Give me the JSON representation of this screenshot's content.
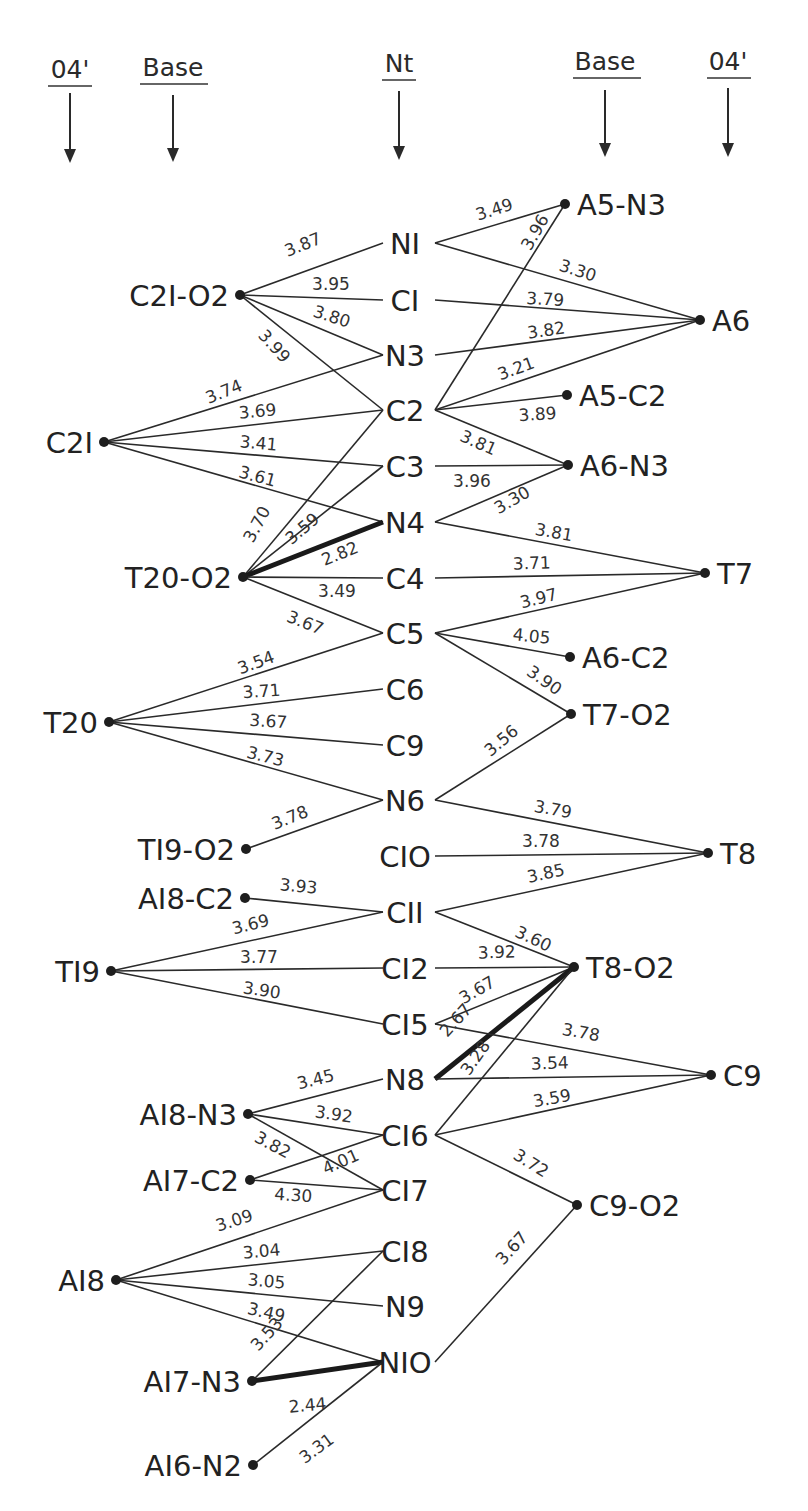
{
  "headers": [
    {
      "id": "o4-left",
      "label": "04'",
      "x": 70,
      "label_y": 78,
      "underline": [
        48,
        92,
        86
      ],
      "arrow": [
        93,
        163
      ]
    },
    {
      "id": "base-left",
      "label": "Base",
      "x": 173,
      "label_y": 76,
      "underline": [
        140,
        208,
        84
      ],
      "arrow": [
        95,
        162
      ]
    },
    {
      "id": "nt",
      "label": "Nt",
      "x": 399,
      "label_y": 72,
      "underline": [
        382,
        416,
        80
      ],
      "arrow": [
        91,
        160
      ]
    },
    {
      "id": "base-right",
      "label": "Base",
      "x": 605,
      "label_y": 70,
      "underline": [
        573,
        641,
        78
      ],
      "arrow": [
        90,
        157
      ]
    },
    {
      "id": "o4-right",
      "label": "04'",
      "x": 728,
      "label_y": 70,
      "underline": [
        707,
        751,
        78
      ],
      "arrow": [
        88,
        157
      ]
    }
  ],
  "nt_atoms": [
    {
      "id": "N1",
      "label": "NI",
      "x": 405,
      "y": 243
    },
    {
      "id": "C1",
      "label": "CI",
      "x": 405,
      "y": 300
    },
    {
      "id": "N3",
      "label": "N3",
      "x": 405,
      "y": 355
    },
    {
      "id": "C2",
      "label": "C2",
      "x": 405,
      "y": 410
    },
    {
      "id": "C3",
      "label": "C3",
      "x": 405,
      "y": 466
    },
    {
      "id": "N4",
      "label": "N4",
      "x": 405,
      "y": 522
    },
    {
      "id": "C4",
      "label": "C4",
      "x": 405,
      "y": 578
    },
    {
      "id": "C5",
      "label": "C5",
      "x": 405,
      "y": 633
    },
    {
      "id": "C6",
      "label": "C6",
      "x": 405,
      "y": 689
    },
    {
      "id": "C9n",
      "label": "C9",
      "x": 405,
      "y": 745
    },
    {
      "id": "N6",
      "label": "N6",
      "x": 405,
      "y": 800
    },
    {
      "id": "C10",
      "label": "CIO",
      "x": 405,
      "y": 856
    },
    {
      "id": "C11",
      "label": "CII",
      "x": 405,
      "y": 912
    },
    {
      "id": "C12",
      "label": "CI2",
      "x": 405,
      "y": 968
    },
    {
      "id": "C15",
      "label": "CI5",
      "x": 405,
      "y": 1024
    },
    {
      "id": "N8",
      "label": "N8",
      "x": 405,
      "y": 1079
    },
    {
      "id": "C16",
      "label": "CI6",
      "x": 405,
      "y": 1135
    },
    {
      "id": "C17",
      "label": "CI7",
      "x": 405,
      "y": 1190
    },
    {
      "id": "C18",
      "label": "CI8",
      "x": 405,
      "y": 1251
    },
    {
      "id": "N9",
      "label": "N9",
      "x": 405,
      "y": 1306
    },
    {
      "id": "N10",
      "label": "NIO",
      "x": 405,
      "y": 1362
    }
  ],
  "left_partners": [
    {
      "id": "C21-O2",
      "label": "C2I-O2",
      "x": 240,
      "y": 295
    },
    {
      "id": "C21",
      "label": "C2I",
      "x": 104,
      "y": 442
    },
    {
      "id": "T20-O2",
      "label": "T20-O2",
      "x": 243,
      "y": 577
    },
    {
      "id": "T20",
      "label": "T20",
      "x": 109,
      "y": 722
    },
    {
      "id": "T19-O2",
      "label": "TI9-O2",
      "x": 246,
      "y": 849
    },
    {
      "id": "A18-C2",
      "label": "AI8-C2",
      "x": 245,
      "y": 898
    },
    {
      "id": "T19",
      "label": "TI9",
      "x": 111,
      "y": 971
    },
    {
      "id": "A18-N3",
      "label": "AI8-N3",
      "x": 248,
      "y": 1114
    },
    {
      "id": "A17-C2",
      "label": "AI7-C2",
      "x": 250,
      "y": 1180
    },
    {
      "id": "A18",
      "label": "AI8",
      "x": 116,
      "y": 1280
    },
    {
      "id": "A17-N3",
      "label": "AI7-N3",
      "x": 252,
      "y": 1381
    },
    {
      "id": "A16-N2",
      "label": "AI6-N2",
      "x": 253,
      "y": 1465
    }
  ],
  "right_partners": [
    {
      "id": "A5-N3",
      "label": "A5-N3",
      "x": 565,
      "y": 204
    },
    {
      "id": "A6",
      "label": "A6",
      "x": 700,
      "y": 320
    },
    {
      "id": "A5-C2",
      "label": "A5-C2",
      "x": 567,
      "y": 395
    },
    {
      "id": "A6-N3",
      "label": "A6-N3",
      "x": 568,
      "y": 465
    },
    {
      "id": "T7",
      "label": "T7",
      "x": 705,
      "y": 573
    },
    {
      "id": "A6-C2",
      "label": "A6-C2",
      "x": 570,
      "y": 657
    },
    {
      "id": "T7-O2",
      "label": "T7-O2",
      "x": 571,
      "y": 714
    },
    {
      "id": "T8",
      "label": "T8",
      "x": 708,
      "y": 853
    },
    {
      "id": "T8-O2",
      "label": "T8-O2",
      "x": 574,
      "y": 967
    },
    {
      "id": "C9",
      "label": "C9",
      "x": 711,
      "y": 1075
    },
    {
      "id": "C9-O2",
      "label": "C9-O2",
      "x": 577,
      "y": 1205
    }
  ],
  "contacts": [
    {
      "from": "C21-O2",
      "to": "N1",
      "distance": "3.87",
      "bold": false
    },
    {
      "from": "C21-O2",
      "to": "C1",
      "distance": "3.95",
      "bold": false
    },
    {
      "from": "C21-O2",
      "to": "N3",
      "distance": "3.80",
      "bold": false
    },
    {
      "from": "C21-O2",
      "to": "C2",
      "distance": "3.99",
      "bold": false
    },
    {
      "from": "C21",
      "to": "N3",
      "distance": "3.74",
      "bold": false
    },
    {
      "from": "C21",
      "to": "C2",
      "distance": "3.69",
      "bold": false
    },
    {
      "from": "C21",
      "to": "C3",
      "distance": "3.41",
      "bold": false
    },
    {
      "from": "C21",
      "to": "N4",
      "distance": "3.61",
      "bold": false
    },
    {
      "from": "T20-O2",
      "to": "C2",
      "distance": "3.70",
      "bold": false
    },
    {
      "from": "T20-O2",
      "to": "C3",
      "distance": "3.59",
      "bold": false
    },
    {
      "from": "T20-O2",
      "to": "N4",
      "distance": "2.82",
      "bold": true
    },
    {
      "from": "T20-O2",
      "to": "C4",
      "distance": "3.49",
      "bold": false
    },
    {
      "from": "T20-O2",
      "to": "C5",
      "distance": "3.67",
      "bold": false
    },
    {
      "from": "T20",
      "to": "C5",
      "distance": "3.54",
      "bold": false
    },
    {
      "from": "T20",
      "to": "C6",
      "distance": "3.71",
      "bold": false
    },
    {
      "from": "T20",
      "to": "C9n",
      "distance": "3.67",
      "bold": false
    },
    {
      "from": "T20",
      "to": "N6",
      "distance": "3.73",
      "bold": false
    },
    {
      "from": "T19-O2",
      "to": "N6",
      "distance": "3.78",
      "bold": false
    },
    {
      "from": "A18-C2",
      "to": "C11",
      "distance": "3.93",
      "bold": false
    },
    {
      "from": "T19",
      "to": "C11",
      "distance": "3.69",
      "bold": false
    },
    {
      "from": "T19",
      "to": "C12",
      "distance": "3.77",
      "bold": false
    },
    {
      "from": "T19",
      "to": "C15",
      "distance": "3.90",
      "bold": false
    },
    {
      "from": "A18-N3",
      "to": "N8",
      "distance": "3.45",
      "bold": false
    },
    {
      "from": "A18-N3",
      "to": "C16",
      "distance": "3.92",
      "bold": false
    },
    {
      "from": "A18-N3",
      "to": "C17",
      "distance": "3.82",
      "bold": false
    },
    {
      "from": "A17-C2",
      "to": "C16",
      "distance": "4.01",
      "bold": false
    },
    {
      "from": "A17-C2",
      "to": "C17",
      "distance": "4.30",
      "bold": false
    },
    {
      "from": "A18",
      "to": "C17",
      "distance": "3.09",
      "bold": false
    },
    {
      "from": "A18",
      "to": "C18",
      "distance": "3.04",
      "bold": false
    },
    {
      "from": "A18",
      "to": "N9",
      "distance": "3.05",
      "bold": false
    },
    {
      "from": "A18",
      "to": "N10",
      "distance": "3.49",
      "bold": false
    },
    {
      "from": "A17-N3",
      "to": "C18",
      "distance": "3.53",
      "bold": false
    },
    {
      "from": "A17-N3",
      "to": "N10",
      "distance": "2.44",
      "bold": true
    },
    {
      "from": "A16-N2",
      "to": "N10",
      "distance": "3.31",
      "bold": false
    },
    {
      "from": "N1",
      "to": "A5-N3",
      "distance": "3.49",
      "bold": false
    },
    {
      "from": "N1",
      "to": "A6",
      "distance": "3.30",
      "bold": false
    },
    {
      "from": "C1",
      "to": "A6",
      "distance": "3.79",
      "bold": false
    },
    {
      "from": "N3",
      "to": "A6",
      "distance": "3.82",
      "bold": false
    },
    {
      "from": "C2",
      "to": "A5-N3",
      "distance": "3.96",
      "bold": false
    },
    {
      "from": "C2",
      "to": "A6",
      "distance": "3.21",
      "bold": false
    },
    {
      "from": "C2",
      "to": "A5-C2",
      "distance": "3.89",
      "bold": false
    },
    {
      "from": "C2",
      "to": "A6-N3",
      "distance": "3.81",
      "bold": false
    },
    {
      "from": "C3",
      "to": "A6-N3",
      "distance": "3.96",
      "bold": false
    },
    {
      "from": "N4",
      "to": "A6-N3",
      "distance": "3.30",
      "bold": false
    },
    {
      "from": "N4",
      "to": "T7",
      "distance": "3.81",
      "bold": false
    },
    {
      "from": "C4",
      "to": "T7",
      "distance": "3.71",
      "bold": false
    },
    {
      "from": "C5",
      "to": "T7",
      "distance": "3.97",
      "bold": false
    },
    {
      "from": "C5",
      "to": "A6-C2",
      "distance": "4.05",
      "bold": false
    },
    {
      "from": "C5",
      "to": "T7-O2",
      "distance": "3.90",
      "bold": false
    },
    {
      "from": "N6",
      "to": "T7-O2",
      "distance": "3.56",
      "bold": false
    },
    {
      "from": "N6",
      "to": "T8",
      "distance": "3.79",
      "bold": false
    },
    {
      "from": "C10",
      "to": "T8",
      "distance": "3.78",
      "bold": false
    },
    {
      "from": "C11",
      "to": "T8",
      "distance": "3.85",
      "bold": false
    },
    {
      "from": "C11",
      "to": "T8-O2",
      "distance": "3.60",
      "bold": false
    },
    {
      "from": "C12",
      "to": "T8-O2",
      "distance": "3.92",
      "bold": false
    },
    {
      "from": "C15",
      "to": "T8-O2",
      "distance": "3.67",
      "bold": false
    },
    {
      "from": "N8",
      "to": "T8-O2",
      "distance": "2.67",
      "bold": true
    },
    {
      "from": "C16",
      "to": "T8-O2",
      "distance": "3.28",
      "bold": false
    },
    {
      "from": "C15",
      "to": "C9",
      "distance": "3.78",
      "bold": false
    },
    {
      "from": "N8",
      "to": "C9",
      "distance": "3.54",
      "bold": false
    },
    {
      "from": "C16",
      "to": "C9",
      "distance": "3.59",
      "bold": false
    },
    {
      "from": "C16",
      "to": "C9-O2",
      "distance": "3.72",
      "bold": false
    },
    {
      "from": "N10",
      "to": "C9-O2",
      "distance": "3.67",
      "bold": false
    }
  ],
  "label_positions": {
    "C21-O2|N1": [
      305,
      250,
      -22
    ],
    "C21-O2|C1": [
      331,
      290,
      0
    ],
    "C21-O2|N3": [
      330,
      322,
      18
    ],
    "C21-O2|C2": [
      270,
      350,
      48
    ],
    "C21|N3": [
      226,
      397,
      -22
    ],
    "C21|C2": [
      258,
      417,
      -5
    ],
    "C21|C3": [
      258,
      449,
      5
    ],
    "C21|N4": [
      256,
      482,
      15
    ],
    "T20-O2|C2": [
      262,
      527,
      -62
    ],
    "T20-O2|C3": [
      306,
      533,
      -40
    ],
    "T20-O2|N4": [
      342,
      559,
      -22
    ],
    "T20-O2|C4": [
      337,
      597,
      0
    ],
    "T20-O2|C5": [
      303,
      628,
      22
    ],
    "T20|C5": [
      258,
      668,
      -20
    ],
    "T20|C6": [
      262,
      697,
      -4
    ],
    "T20|C9n": [
      268,
      727,
      4
    ],
    "T20|N6": [
      264,
      762,
      14
    ],
    "T19-O2|N6": [
      292,
      823,
      -22
    ],
    "A18-C2|C11": [
      298,
      892,
      5
    ],
    "T19|C11": [
      252,
      930,
      -14
    ],
    "T19|C12": [
      259,
      963,
      0
    ],
    "T19|C15": [
      261,
      996,
      8
    ],
    "A18-N3|N8": [
      317,
      1085,
      -14
    ],
    "A18-N3|C16": [
      333,
      1120,
      8
    ],
    "A18-N3|C17": [
      270,
      1150,
      28
    ],
    "A17-C2|C16": [
      343,
      1167,
      -24
    ],
    "A17-C2|C17": [
      293,
      1201,
      4
    ],
    "A18|C17": [
      236,
      1226,
      -18
    ],
    "A18|C18": [
      262,
      1257,
      -5
    ],
    "A18|N9": [
      266,
      1287,
      5
    ],
    "A18|N10": [
      265,
      1318,
      13
    ],
    "A17-N3|C18": [
      271,
      1338,
      -48
    ],
    "A17-N3|N10": [
      308,
      1411,
      -5
    ],
    "A16-N2|N10": [
      320,
      1453,
      -36
    ],
    "N1|A5-N3": [
      496,
      215,
      -18
    ],
    "N1|A6": [
      576,
      276,
      18
    ],
    "C1|A6": [
      545,
      305,
      3
    ],
    "N3|A6": [
      547,
      336,
      -8
    ],
    "C2|A5-N3": [
      540,
      235,
      -60
    ],
    "C2|A6": [
      518,
      374,
      -20
    ],
    "C2|A5-C2": [
      538,
      420,
      -4
    ],
    "C2|A6-N3": [
      476,
      448,
      24
    ],
    "C3|A6-N3": [
      472,
      487,
      0
    ],
    "N4|A6-N3": [
      515,
      505,
      -30
    ],
    "N4|T7": [
      553,
      538,
      10
    ],
    "C4|T7": [
      532,
      569,
      -2
    ],
    "C5|T7": [
      540,
      604,
      -14
    ],
    "C5|A6-C2": [
      531,
      642,
      6
    ],
    "C5|T7-O2": [
      541,
      685,
      35
    ],
    "N6|T7-O2": [
      505,
      745,
      -40
    ],
    "N6|T8": [
      552,
      815,
      10
    ],
    "C10|T8": [
      541,
      847,
      0
    ],
    "C11|T8": [
      547,
      879,
      -12
    ],
    "C11|T8-O2": [
      531,
      944,
      25
    ],
    "C12|T8-O2": [
      497,
      958,
      -2
    ],
    "C15|T8-O2": [
      480,
      995,
      -30
    ],
    "N8|T8-O2": [
      460,
      1024,
      -48
    ],
    "C16|T8-O2": [
      480,
      1061,
      -55
    ],
    "C15|C9": [
      580,
      1038,
      10
    ],
    "N8|C9": [
      550,
      1069,
      -2
    ],
    "C16|C9": [
      553,
      1104,
      -10
    ],
    "C16|C9-O2": [
      528,
      1168,
      32
    ],
    "N10|C9-O2": [
      516,
      1252,
      -48
    ]
  },
  "colors": {
    "ink": "#222222",
    "background": "#ffffff"
  }
}
